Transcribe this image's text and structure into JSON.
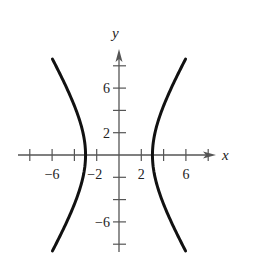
{
  "chart_data": {
    "type": "line",
    "title": "",
    "equation": "x^2/9 - y^2/25 = 1",
    "xlabel": "x",
    "ylabel": "y",
    "xlim": [
      -9,
      9
    ],
    "ylim": [
      -9,
      9
    ],
    "grid": false,
    "legend": null,
    "x_ticks": [
      -8,
      -6,
      -4,
      -2,
      2,
      4,
      6,
      8
    ],
    "y_ticks": [
      -8,
      -6,
      -4,
      -2,
      2,
      4,
      6,
      8
    ],
    "x_tick_labels": [
      {
        "value": -6,
        "label": "−6"
      },
      {
        "value": -2,
        "label": "−2"
      },
      {
        "value": 2,
        "label": "2"
      },
      {
        "value": 6,
        "label": "6"
      }
    ],
    "y_tick_labels": [
      {
        "value": 6,
        "label": "6"
      },
      {
        "value": 2,
        "label": "2"
      },
      {
        "value": -6,
        "label": "−6"
      }
    ],
    "series": [
      {
        "name": "right branch",
        "a": 3,
        "b": 5,
        "side": 1,
        "y_range": [
          -8.6,
          8.6
        ],
        "sample_points": [
          [
            6.0,
            -8.6
          ],
          [
            4.24,
            -5
          ],
          [
            3.0,
            0
          ],
          [
            4.24,
            5
          ],
          [
            6.0,
            8.6
          ]
        ]
      },
      {
        "name": "left branch",
        "a": 3,
        "b": 5,
        "side": -1,
        "y_range": [
          -8.6,
          8.6
        ],
        "sample_points": [
          [
            -6.0,
            -8.6
          ],
          [
            -4.24,
            -5
          ],
          [
            -3.0,
            0
          ],
          [
            -4.24,
            5
          ],
          [
            -6.0,
            8.6
          ]
        ]
      }
    ],
    "vertices": [
      [
        -3,
        0
      ],
      [
        3,
        0
      ]
    ],
    "colors": {
      "curve": "#111111",
      "axis": "#555555"
    }
  }
}
